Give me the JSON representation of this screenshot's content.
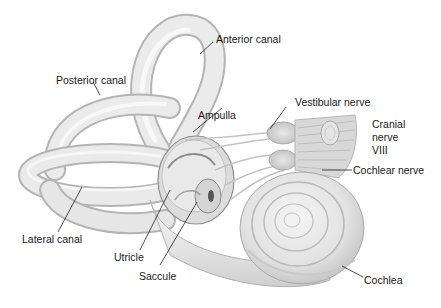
{
  "figure": {
    "background": "#ffffff",
    "structure_fill": "#ececec",
    "structure_stroke": "#a8a8a8",
    "text_color": "#1a1a1a"
  },
  "labels": {
    "anterior_canal": "Anterior canal",
    "posterior_canal": "Posterior canal",
    "ampulla": "Ampulla",
    "vestibular_nerve": "Vestibular nerve",
    "cranial_nerve_line1": "Cranial",
    "cranial_nerve_line2": "nerve",
    "cranial_nerve_line3": "VIII",
    "cochlear_nerve": "Cochlear nerve",
    "lateral_canal": "Lateral canal",
    "utricle": "Utricle",
    "saccule": "Saccule",
    "cochlea": "Cochlea"
  }
}
